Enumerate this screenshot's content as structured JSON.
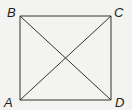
{
  "diagram": {
    "type": "square-with-diagonals",
    "vertices": [
      {
        "id": "B",
        "label": "B",
        "corner": "top-left"
      },
      {
        "id": "C",
        "label": "C",
        "corner": "top-right"
      },
      {
        "id": "A",
        "label": "A",
        "corner": "bottom-left"
      },
      {
        "id": "D",
        "label": "D",
        "corner": "bottom-right"
      }
    ],
    "edges": [
      [
        "A",
        "B"
      ],
      [
        "B",
        "C"
      ],
      [
        "C",
        "D"
      ],
      [
        "D",
        "A"
      ]
    ],
    "diagonals": [
      [
        "B",
        "D"
      ],
      [
        "A",
        "C"
      ]
    ],
    "colors": {
      "stroke": "#333333",
      "background": "#f3f3f1"
    }
  }
}
